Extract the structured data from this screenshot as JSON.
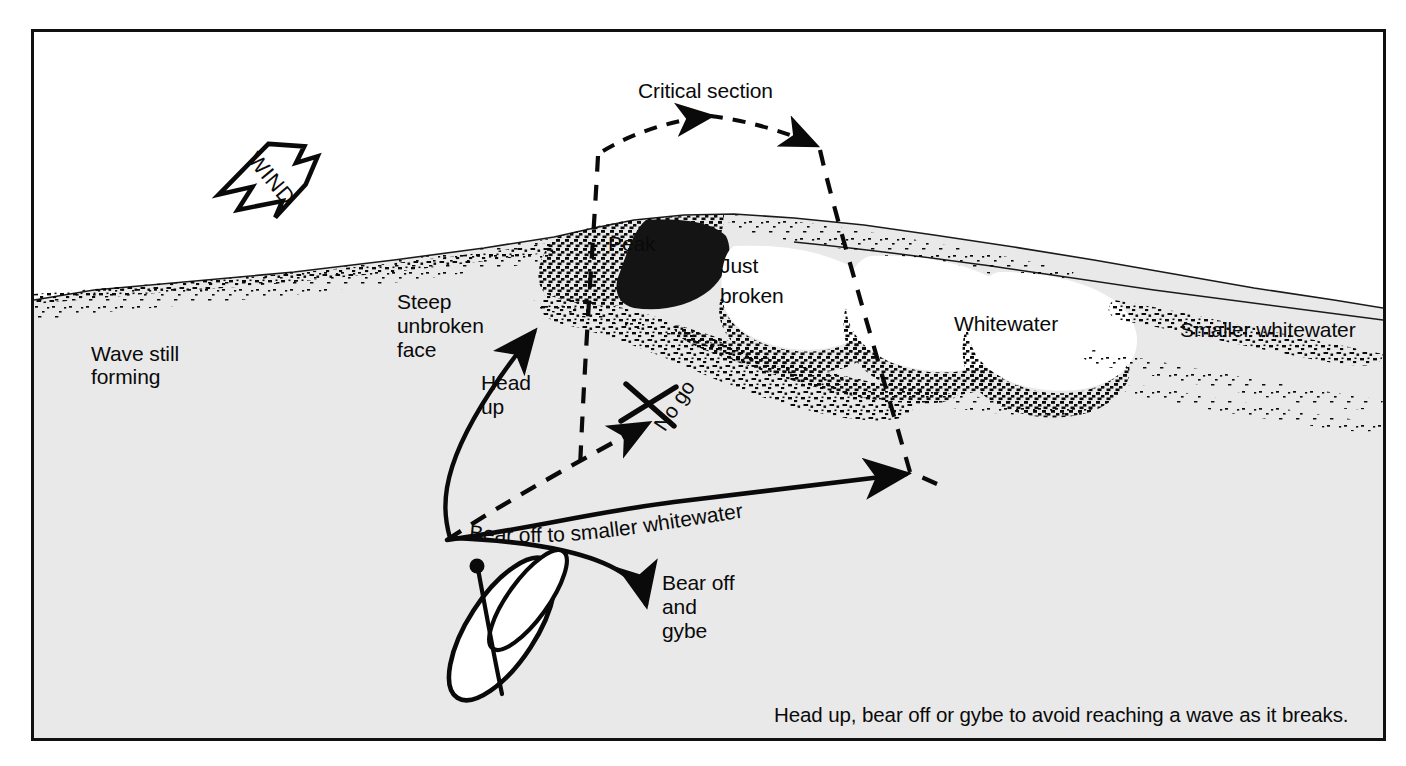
{
  "figure": {
    "kind": "instructional-diagram",
    "caption": "Head up, bear off or gybe to avoid reaching a wave as it breaks.",
    "frame_color": "#111111",
    "sky_color": "#ffffff",
    "water_color": "#e9e9e9",
    "ink_color": "#0a0a0a"
  },
  "wind": {
    "label": "WIND",
    "direction_degrees": 45,
    "icon": "wind-arrow-icon"
  },
  "callouts": {
    "critical_section": "Critical section",
    "wave_still_forming": "Wave still\nforming",
    "steep_unbroken_face": "Steep\nunbroken\nface",
    "peak": "Peak",
    "just_broken": "Just\nbroken",
    "whitewater": "Whitewater",
    "smaller_whitewater": "Smaller whitewater"
  },
  "maneuvers": {
    "head_up": "Head\nup",
    "no_go": "No go",
    "bear_off_to_smaller_whitewater": "Bear off to smaller whitewater",
    "bear_off_and_gybe": "Bear off\nand\ngybe"
  },
  "labels_flat": {
    "wave_still_forming_line1": "Wave still",
    "wave_still_forming_line2": "forming",
    "steep_line1": "Steep",
    "steep_line2": "unbroken",
    "steep_line3": "face",
    "just_broken_line1": "Just",
    "just_broken_line2": "broken",
    "head_up_line1": "Head",
    "head_up_line2": "up",
    "bear_off_gybe_line1": "Bear off",
    "bear_off_gybe_line2": "and",
    "bear_off_gybe_line3": "gybe"
  },
  "board": {
    "name": "windsurfer-top-view",
    "parts": [
      "board-hull",
      "sail",
      "mast",
      "mast-head-dot"
    ]
  }
}
